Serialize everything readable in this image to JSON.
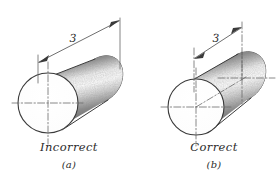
{
  "figure": {
    "background_color": "#ffffff",
    "ink_color": "#3a3a3a",
    "panels": [
      {
        "id": "a",
        "caption": "Incorrect",
        "sub_caption": "(a)",
        "dimension_value": "3",
        "shape": "cylinder",
        "has_axis_centerline": false,
        "has_end_centerlines": false,
        "notes": "dimension extension lines are vertical object lines, no axis centerline shown"
      },
      {
        "id": "b",
        "caption": "Correct",
        "sub_caption": "(b)",
        "dimension_value": "3",
        "shape": "cylinder",
        "has_axis_centerline": true,
        "has_end_centerlines": true,
        "notes": "extension lines are centerlines extending from the end centers, axis centerline drawn"
      }
    ]
  }
}
